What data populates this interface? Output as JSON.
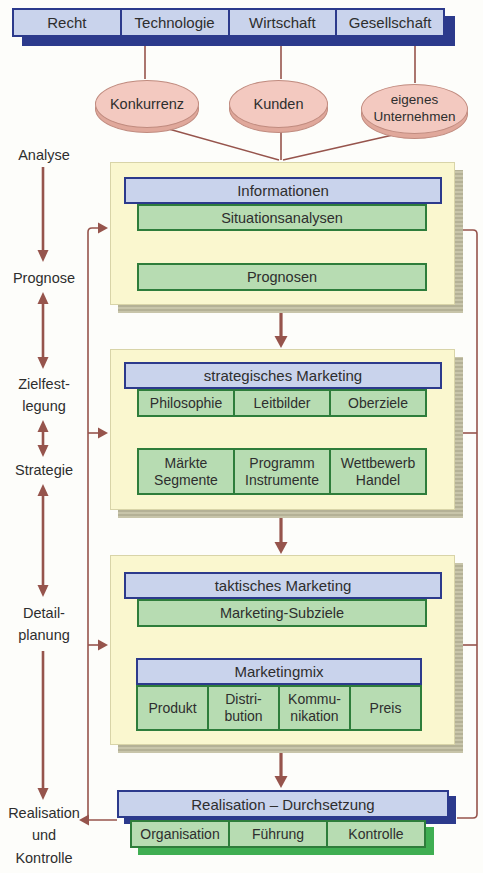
{
  "environment_bar": {
    "cells": [
      "Recht",
      "Technologie",
      "Wirtschaft",
      "Gesellschaft"
    ]
  },
  "market_ellipses": {
    "konkurrenz": "Konkurrenz",
    "kunden": "Kunden",
    "eigenes_unternehmen": "eigenes\nUnternehmen"
  },
  "stage_labels": {
    "analyse": "Analyse",
    "prognose": "Prognose",
    "zielfestlegung": "Zielfest-\nlegung",
    "strategie": "Strategie",
    "detailplanung": "Detail-\nplanung",
    "realisation_und_kontrolle": "Realisation\nund\nKontrolle"
  },
  "panel_information": {
    "header": "Informationen",
    "row1": "Situationsanalysen",
    "row2": "Prognosen"
  },
  "panel_strategic": {
    "header": "strategisches Marketing",
    "row1": [
      "Philosophie",
      "Leitbilder",
      "Oberziele"
    ],
    "row2": [
      "Märkte\nSegmente",
      "Programm\nInstrumente",
      "Wettbewerb\nHandel"
    ]
  },
  "panel_tactical": {
    "header": "taktisches Marketing",
    "subheader": "Marketing-Subziele",
    "mix_header": "Marketingmix",
    "mix_cells": [
      "Produkt",
      "Distri-\nbution",
      "Kommu-\nnikation",
      "Preis"
    ]
  },
  "realisation": {
    "header": "Realisation – Durchsetzung",
    "cells": [
      "Organisation",
      "Führung",
      "Kontrolle"
    ]
  },
  "colors": {
    "navy": "#2c3a8c",
    "light_blue": "#c9d3ec",
    "panel_yellow": "#faf7cf",
    "panel_shadow_gray": "#bdbaa0",
    "green_fill": "#b7dcb2",
    "green_border": "#2e7d3b",
    "green_shadow": "#3fae52",
    "pink_fill": "#f3c9c0",
    "pink_rim": "#e0a89b",
    "arrow_maroon": "#96544c"
  }
}
